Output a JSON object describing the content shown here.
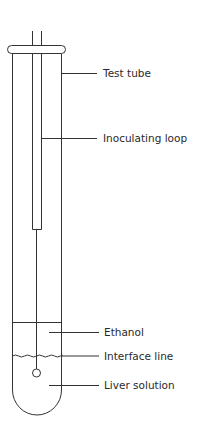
{
  "diagram": {
    "labels": {
      "test_tube": "Test tube",
      "inoculating_loop": "Inoculating loop",
      "ethanol": "Ethanol",
      "interface_line": "Interface line",
      "liver_solution": "Liver solution"
    },
    "colors": {
      "stroke": "#333333",
      "text": "#2a2a2a",
      "background": "#ffffff"
    }
  }
}
